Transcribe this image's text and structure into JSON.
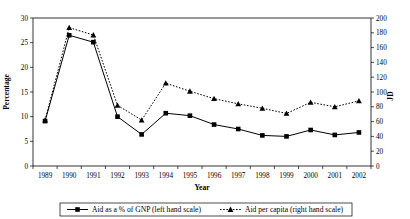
{
  "chart_data": {
    "type": "line",
    "title": "",
    "xlabel": "Year",
    "ylabel": "Percentage",
    "y2label": "JD",
    "grid": false,
    "legend_position": "bottom",
    "categories": [
      "1989",
      "1990",
      "1991",
      "1992",
      "1993",
      "1994",
      "1995",
      "1996",
      "1997",
      "1998",
      "1999",
      "2000",
      "2001",
      "2002"
    ],
    "ylim": [
      0,
      30
    ],
    "yticks": [
      0,
      5,
      10,
      15,
      20,
      25,
      30
    ],
    "y2lim": [
      0,
      200
    ],
    "y2ticks": [
      0,
      20,
      40,
      60,
      80,
      100,
      120,
      140,
      160,
      180,
      200
    ],
    "series": [
      {
        "name": "Aid as a % of GNP (left hand scale)",
        "axis": "left",
        "marker": "square",
        "line": "solid",
        "color": "#000000",
        "values": [
          9.1,
          26.5,
          25.1,
          10.0,
          6.4,
          10.7,
          10.2,
          8.4,
          7.5,
          6.2,
          6.0,
          7.3,
          6.3,
          6.8
        ]
      },
      {
        "name": "Aid per capita (right hand scale)",
        "axis": "right",
        "marker": "triangle",
        "line": "dotted",
        "color": "#000000",
        "values": [
          62,
          187,
          177,
          82,
          62,
          112,
          101,
          91,
          84,
          78,
          71,
          86,
          80,
          88
        ]
      }
    ],
    "legend_entries": [
      "Aid as a % of GNP (left hand scale)",
      "Aid per capita (right hand scale)"
    ]
  },
  "axes": {
    "y_left_ticks": [
      "0",
      "5",
      "10",
      "15",
      "20",
      "25",
      "30"
    ],
    "y_right_ticks": [
      "0",
      "20",
      "40",
      "60",
      "80",
      "100",
      "120",
      "140",
      "160",
      "180",
      "200"
    ],
    "x_ticks": [
      "1989",
      "1990",
      "1991",
      "1992",
      "1993",
      "1994",
      "1995",
      "1996",
      "1997",
      "1998",
      "1999",
      "2000",
      "2001",
      "2002"
    ],
    "y_left_title": "Percentage",
    "y_right_title": "JD",
    "x_title": "Year"
  }
}
